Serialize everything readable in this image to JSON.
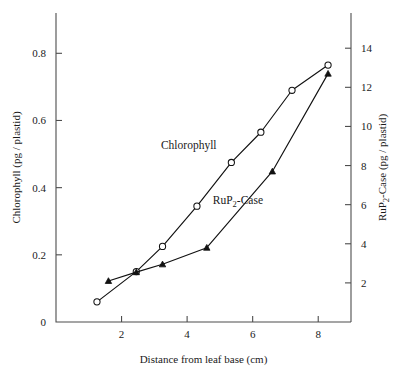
{
  "chart_data": {
    "type": "line",
    "title": "",
    "xlabel": "Distance from leaf base (cm)",
    "ylabel": "Chlorophyll (pg / plastid)",
    "y2label": "RuP2-Case (pg / plastid)",
    "y2label_parts": {
      "pre": "RuP",
      "sub": "2",
      "post": "-Case (pg / plastid)"
    },
    "xlim": [
      0,
      9
    ],
    "ylim": [
      0,
      0.92
    ],
    "y2lim": [
      0,
      15.8
    ],
    "grid": false,
    "legend": "inline-annotations",
    "xticks": [
      2,
      4,
      6,
      8
    ],
    "xtick_labels": [
      "2",
      "4",
      "6",
      "8"
    ],
    "yticks": [
      0,
      0.2,
      0.4,
      0.6,
      0.8
    ],
    "ytick_labels": [
      "0",
      "0.2",
      "0.4",
      "0.6",
      "0.8"
    ],
    "y2ticks": [
      2,
      4,
      6,
      8,
      10,
      12,
      14
    ],
    "y2tick_labels": [
      "2",
      "4",
      "6",
      "8",
      "10",
      "12",
      "14"
    ],
    "series": [
      {
        "name": "Chlorophyll",
        "axis": "left",
        "marker": "open-circle",
        "annotation": "Chlorophyll",
        "annotation_x": 4.05,
        "annotation_y": 0.515,
        "points": [
          {
            "x": 1.25,
            "y": 0.06
          },
          {
            "x": 2.45,
            "y": 0.15
          },
          {
            "x": 3.25,
            "y": 0.225
          },
          {
            "x": 4.3,
            "y": 0.345
          },
          {
            "x": 5.35,
            "y": 0.475
          },
          {
            "x": 6.25,
            "y": 0.565
          },
          {
            "x": 7.2,
            "y": 0.69
          },
          {
            "x": 8.3,
            "y": 0.765
          }
        ]
      },
      {
        "name": "RuP2-Case",
        "axis": "right",
        "marker": "filled-triangle",
        "annotation": "RuP2-Case",
        "annotation_parts": {
          "pre": "RuP",
          "sub": "2",
          "post": "-Case"
        },
        "annotation_x": 5.55,
        "annotation_y_right": 6.05,
        "points": [
          {
            "x": 1.6,
            "y": 2.1
          },
          {
            "x": 2.45,
            "y": 2.55
          },
          {
            "x": 3.25,
            "y": 2.95
          },
          {
            "x": 4.6,
            "y": 3.8
          },
          {
            "x": 6.6,
            "y": 7.7
          },
          {
            "x": 8.3,
            "y": 12.7
          }
        ]
      }
    ]
  }
}
